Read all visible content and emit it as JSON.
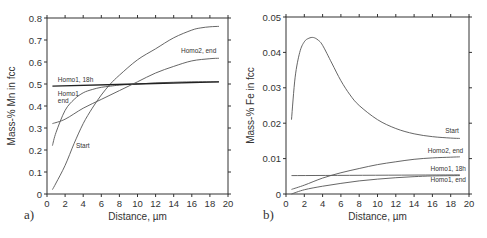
{
  "chart_data": [
    {
      "type": "line",
      "panel_label": "a)",
      "title": "",
      "xlabel": "Distance, µm",
      "ylabel": "Mass-% Mn in fcc",
      "xlim": [
        0,
        20
      ],
      "ylim": [
        0,
        0.8
      ],
      "xticks": [
        "0",
        "2",
        "4",
        "6",
        "8",
        "10",
        "12",
        "14",
        "16",
        "18",
        "20"
      ],
      "yticks": [
        "0",
        "0.1",
        "0.2",
        "0.3",
        "0.4",
        "0.5",
        "0.6",
        "0.7",
        "0.8"
      ],
      "grid": false,
      "series": [
        {
          "name": "Start",
          "x": [
            0.6,
            1,
            2,
            3,
            4,
            5,
            6,
            7,
            8,
            10,
            12,
            14,
            16,
            17,
            18,
            19
          ],
          "y": [
            0.02,
            0.05,
            0.13,
            0.23,
            0.32,
            0.39,
            0.45,
            0.5,
            0.54,
            0.61,
            0.66,
            0.71,
            0.745,
            0.755,
            0.76,
            0.762
          ]
        },
        {
          "name": "Homo1, end",
          "x": [
            0.6,
            1,
            2,
            3,
            4,
            5,
            6,
            7,
            8,
            10,
            12,
            14,
            16,
            19
          ],
          "y": [
            0.22,
            0.28,
            0.38,
            0.43,
            0.46,
            0.475,
            0.485,
            0.49,
            0.495,
            0.5,
            0.505,
            0.508,
            0.51,
            0.51
          ]
        },
        {
          "name": "Homo1, 18h",
          "x": [
            0.6,
            19
          ],
          "y": [
            0.49,
            0.51
          ]
        },
        {
          "name": "Homo2, end",
          "x": [
            0.6,
            2,
            4,
            6,
            8,
            10,
            12,
            14,
            16,
            18,
            19
          ],
          "y": [
            0.32,
            0.34,
            0.39,
            0.43,
            0.47,
            0.51,
            0.55,
            0.58,
            0.605,
            0.615,
            0.617
          ]
        }
      ],
      "annotations": [
        {
          "text": "Homo1, 18h",
          "x": 1.2,
          "y": 0.51
        },
        {
          "text": "Homo1",
          "x": 1.2,
          "y": 0.445
        },
        {
          "text": "end",
          "x": 1.2,
          "y": 0.415
        },
        {
          "text": "Start",
          "x": 3.2,
          "y": 0.21
        },
        {
          "text": "Homo2, end",
          "x": 14.8,
          "y": 0.64
        }
      ]
    },
    {
      "type": "line",
      "panel_label": "b)",
      "title": "",
      "xlabel": "Distance, µm",
      "ylabel": "Mass-% Fe in fcc",
      "xlim": [
        0,
        20
      ],
      "ylim": [
        0,
        0.05
      ],
      "xticks": [
        "0",
        "2",
        "4",
        "6",
        "8",
        "10",
        "12",
        "14",
        "16",
        "18",
        "20"
      ],
      "yticks": [
        "0",
        "0.01",
        "0.02",
        "0.03",
        "0.04",
        "0.05"
      ],
      "grid": false,
      "series": [
        {
          "name": "Start",
          "x": [
            0.6,
            1,
            1.5,
            2,
            2.5,
            3,
            3.5,
            4,
            5,
            6,
            7,
            8,
            10,
            12,
            14,
            16,
            18,
            19
          ],
          "y": [
            0.021,
            0.033,
            0.04,
            0.043,
            0.044,
            0.0442,
            0.0435,
            0.042,
            0.037,
            0.032,
            0.028,
            0.025,
            0.021,
            0.0185,
            0.017,
            0.0162,
            0.0158,
            0.0157
          ]
        },
        {
          "name": "Homo2, end",
          "x": [
            0.6,
            2,
            4,
            6,
            8,
            10,
            12,
            14,
            16,
            18,
            19
          ],
          "y": [
            0.0013,
            0.0025,
            0.0045,
            0.006,
            0.0072,
            0.0083,
            0.0091,
            0.0098,
            0.0102,
            0.0104,
            0.0105
          ]
        },
        {
          "name": "Homo1, 18h",
          "x": [
            0.6,
            19
          ],
          "y": [
            0.0052,
            0.0054
          ]
        },
        {
          "name": "Homo1, end",
          "x": [
            0.6,
            2,
            4,
            6,
            8,
            10,
            12,
            14,
            16,
            19
          ],
          "y": [
            0.0,
            0.0012,
            0.0022,
            0.003,
            0.0037,
            0.0042,
            0.0046,
            0.0049,
            0.0051,
            0.0052
          ]
        }
      ],
      "annotations": [
        {
          "text": "Start",
          "x": 17.4,
          "y": 0.0172
        },
        {
          "text": "Homo2, end",
          "x": 15.5,
          "y": 0.0115
        },
        {
          "text": "Homo1, 18h",
          "x": 15.8,
          "y": 0.0065
        },
        {
          "text": "Homo1, end",
          "x": 15.8,
          "y": 0.0035
        }
      ]
    }
  ]
}
